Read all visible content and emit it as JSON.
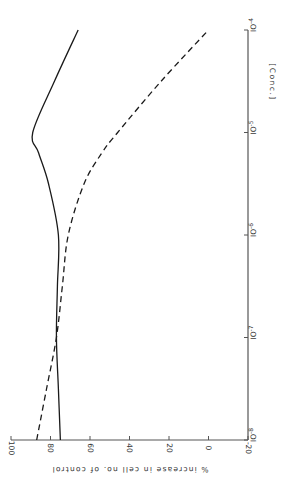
{
  "chart_data": {
    "type": "line",
    "orientation": "rotated 90deg clockwise (x-axis runs vertically on page)",
    "title": "",
    "xlabel": "[Conc.]",
    "ylabel": "% increase in cell no. of control",
    "x_scale": "log",
    "x_ticks": [
      "10^-8",
      "10^-7",
      "10^-6",
      "10^-5",
      "10^-4"
    ],
    "x_tick_labels": [
      "IO-8",
      "IO-7",
      "IO-6",
      "IO-5",
      "IO-4"
    ],
    "y_ticks": [
      100,
      80,
      60,
      40,
      20,
      0,
      -20
    ],
    "y_tick_labels": [
      "100",
      "80",
      "60",
      "40",
      "20",
      "0",
      "-20"
    ],
    "ylim": [
      -20,
      100
    ],
    "xlim_log10": [
      -8,
      -4
    ],
    "grid": false,
    "legend": "none",
    "x_log10": [
      -8,
      -7.5,
      -7,
      -6.5,
      -6,
      -5.5,
      -5.2,
      -5,
      -4.5,
      -4
    ],
    "series": [
      {
        "name": "solid",
        "style": "solid",
        "values": [
          75,
          76,
          77,
          76.5,
          76,
          81,
          86,
          89,
          78,
          66
        ]
      },
      {
        "name": "dashed",
        "style": "dashed",
        "values": [
          87,
          82,
          77,
          74,
          71,
          63,
          54,
          46,
          24,
          0
        ]
      }
    ]
  }
}
